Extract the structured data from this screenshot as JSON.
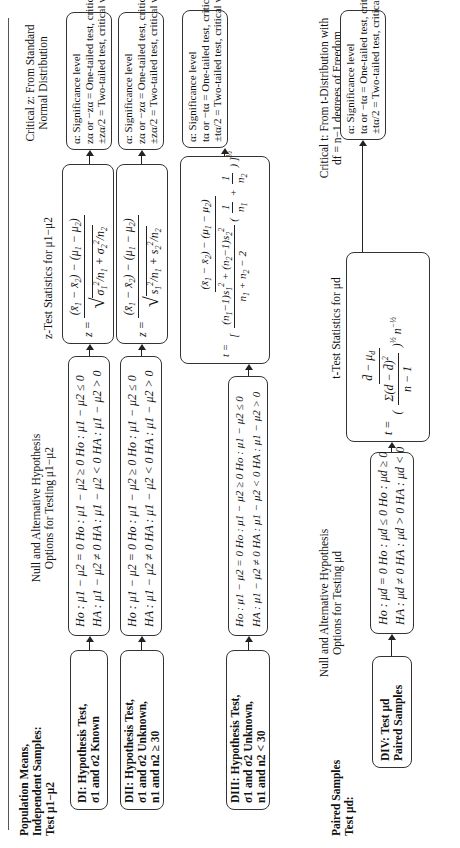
{
  "section_independent": {
    "title_line1": "Population Means,",
    "title_line2": "Independent Samples:",
    "title_line3": "Test μ1−μ2"
  },
  "section_paired": {
    "title_line1": "Paired Samples",
    "title_line2": "Test μd:"
  },
  "headers": {
    "hyp_line1": "Null and Alternative Hypothesis",
    "hyp_line2": "Options for Testing μ1−μ2",
    "ztest": "z-Test Statistics for μ1−μ2",
    "critz_line1": "Critical z: From Standard",
    "critz_line2": "Normal Distribution",
    "hyp_paired_line1": "Null and Alternative Hypothesis",
    "hyp_paired_line2": "Options for Testing μd",
    "ttest_paired": "t-Test Statistics for μd",
    "critt_line1": "Critical t: From t-Distribution with",
    "critt_line2": "df = n−1 degrees of Freedom"
  },
  "rows": [
    {
      "label_line1": "DI: Hypothesis Test,",
      "label_line2": "σ1 and σ2 Known",
      "label_line3": "",
      "hyp_null": "Ho : μ1 − μ2 = 0   Ho : μ1 − μ2 ≥ 0   Ho : μ1 − μ2 ≤ 0",
      "hyp_alt": "HA : μ1 − μ2 ≠ 0   HA : μ1 − μ2 < 0   HA : μ1 − μ2 > 0",
      "formula": "z = ((x̄1 − x̄2) − (μ1 − μ2)) / √(σ1²/n1 + σ2²/n2)",
      "crit_line1": "α: Significance level",
      "crit_line2": "zα or −zα = One-tailed test, critical value",
      "crit_line3": "±zα/2 = Two-tailed test, critical values"
    },
    {
      "label_line1": "DII: Hypothesis Test,",
      "label_line2": "σ1 and σ2 Unknown,",
      "label_line3": "n1 and n2 ≥ 30",
      "hyp_null": "Ho : μ1 − μ2 = 0   Ho : μ1 − μ2 ≥ 0   Ho : μ1 − μ2 ≤ 0",
      "hyp_alt": "HA : μ1 − μ2 ≠ 0   HA : μ1 − μ2 < 0   HA : μ1 − μ2 > 0",
      "formula": "z = ((x̄1 − x̄2) − (μ1 − μ2)) / √(s1²/n1 + s2²/n2)",
      "crit_line1": "α: Significance level",
      "crit_line2": "zα or −zα = One-tailed test, critical value",
      "crit_line3": "±zα/2 = Two-tailed test, critical values"
    },
    {
      "label_line1": "DIII: Hypothesis Test,",
      "label_line2": "σ1 and σ2 Unknown,",
      "label_line3": "n1 and n2 < 30",
      "hyp_null": "Ho : μ1 − μ2 = 0   Ho : μ1 − μ2 ≥ 0   Ho : μ1 − μ2 ≤ 0",
      "hyp_alt": "HA : μ1 − μ2 ≠ 0   HA : μ1 − μ2 < 0   HA : μ1 − μ2 > 0",
      "formula": "t = ((x̄1 − x̄2) − (μ1 − μ2)) / [ ((n1 − 1)s1² + (n2 − 1)s2²)/(n1 + n2 − 2) · (1/n1 + 1/n2) ]^(1/2)",
      "crit_line1": "α: Significance level",
      "crit_line2": "tα or −tα = One-tailed test, critical value",
      "crit_line3": "±tα/2 = Two-tailed test, critical values"
    },
    {
      "label_line1": "DIV: Test μd",
      "label_line2": "Paired Samples",
      "label_line3": "",
      "hyp_null": "Ho : μd = 0   Ho : μd ≤ 0   Ho : μd ≥ 0",
      "hyp_alt": "HA : μd ≠ 0   HA : μd > 0   HA : μd < 0",
      "formula": "t = (d̄ − μd) / ( (Σ(d − d̄)²/(n − 1))^(1/2) · n^(−1/2) )",
      "crit_line1": "α: Significance level",
      "crit_line2": "tα or −tα = One-tailed test, critical value",
      "crit_line3": "±tα/2 = Two-tailed test, critical values"
    }
  ]
}
